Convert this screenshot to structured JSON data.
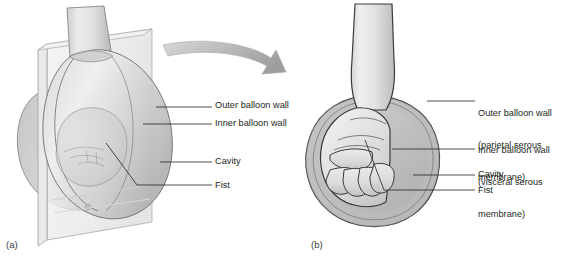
{
  "figure": {
    "background_color": "#ffffff",
    "line_color": "#231f20",
    "fill_light": "#e4e4e4",
    "fill_mid": "#c9c9c9",
    "fill_dark": "#a8a8a8",
    "arrow_color": "#b3b3b3"
  },
  "panels": [
    {
      "tag": "(a)",
      "name": "fist-entering-balloon",
      "labels": [
        {
          "id": "outer",
          "text": "Outer balloon wall"
        },
        {
          "id": "inner",
          "text": "Inner balloon wall"
        },
        {
          "id": "cavity",
          "text": "Cavity"
        },
        {
          "id": "fist",
          "text": "Fist"
        }
      ]
    },
    {
      "tag": "(b)",
      "name": "fist-inside-balloon",
      "labels": [
        {
          "id": "outer",
          "line1": "Outer balloon wall",
          "line2": "(parietal serous",
          "line3": "membrane)"
        },
        {
          "id": "inner",
          "line1": "Inner balloon wall",
          "line2": "(visceral serous",
          "line3": "membrane)"
        },
        {
          "id": "cavity",
          "text": "Cavity"
        },
        {
          "id": "fist",
          "text": "Fist"
        }
      ]
    }
  ],
  "arrow": {
    "name": "transition-arrow",
    "direction": "curved-right"
  }
}
